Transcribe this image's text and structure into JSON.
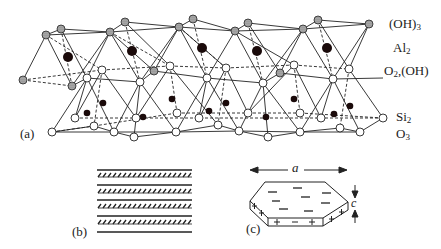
{
  "figure": {
    "panels": {
      "a": {
        "label": "(a)"
      },
      "b": {
        "label": "(b)"
      },
      "c": {
        "label": "(c)"
      }
    },
    "layer_labels": [
      {
        "base": "(OH)",
        "sub": "3"
      },
      {
        "base": "Al",
        "sub": "2"
      },
      {
        "base": "O",
        "sub": "2",
        "suffix": ",(OH)"
      },
      {
        "base": "Si",
        "sub": "2"
      },
      {
        "base": "O",
        "sub": "3"
      }
    ],
    "dimension_labels": {
      "width": "a",
      "thickness": "c"
    },
    "charges": {
      "face": "−",
      "edge_plus": "+",
      "edge_minus": "−"
    }
  },
  "colors": {
    "ink": "#222222",
    "background": "#ffffff",
    "hatched_atom": "#777777"
  }
}
